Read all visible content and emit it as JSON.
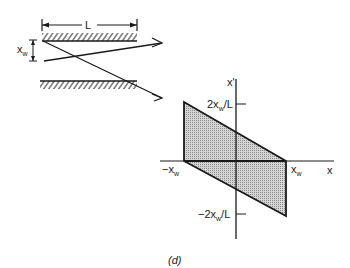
{
  "figure": {
    "caption": "(d)",
    "optics": {
      "length_label": "L",
      "width_label_main": "x",
      "width_label_sub": "w"
    },
    "phase_space": {
      "x_axis_label": "x",
      "y_axis_label": "x'",
      "pos_x_label_main": "x",
      "pos_x_label_sub": "w",
      "neg_x_label_main": "−x",
      "neg_x_label_sub": "w",
      "top_tick_main": "2x",
      "top_tick_sub": "w",
      "top_tick_suffix": "/L",
      "bottom_tick_main": "−2x",
      "bottom_tick_sub": "w",
      "bottom_tick_suffix": "/L",
      "fill_color": "#bdbdbd",
      "line_color": "#1a1a1a"
    }
  }
}
